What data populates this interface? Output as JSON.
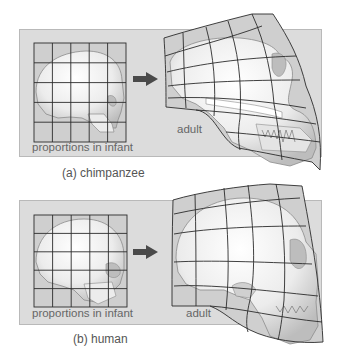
{
  "figure": {
    "panels": [
      {
        "id": "a",
        "caption": "(a) chimpanzee",
        "infant_label": "proportions in infant",
        "adult_label": "adult"
      },
      {
        "id": "b",
        "caption": "(b) human",
        "infant_label": "proportions in infant",
        "adult_label": "adult"
      }
    ],
    "colors": {
      "panel_bg": "#dcdcdc",
      "grid_fill": "#cfcfcf",
      "grid_line": "#2b2b2b",
      "bone": "#f2f2f2",
      "arrow": "#4a4a4a",
      "text": "#666666"
    }
  }
}
